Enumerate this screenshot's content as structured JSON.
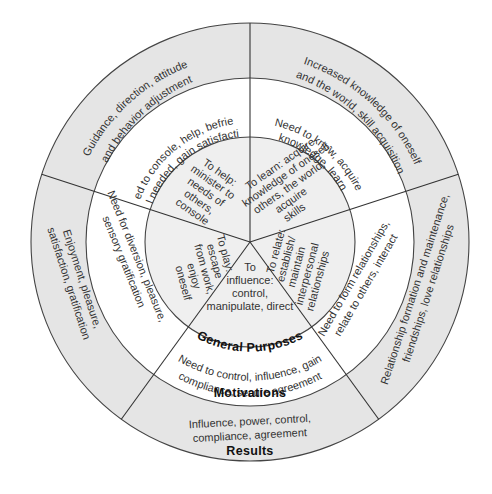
{
  "diagram": {
    "type": "concentric-wheel",
    "center": [
      250,
      242
    ],
    "radii": {
      "results": 219,
      "motivations": 164,
      "general_purposes": 105
    },
    "colors": {
      "results_ring": "#e5e5e5",
      "motivations_ring": "#ffffff",
      "purposes_ring": "#efefef",
      "lines": "#444444"
    },
    "ring_labels": {
      "general_purposes": "General Purposes",
      "motivations": "Motivations",
      "results": "Results"
    },
    "segments": [
      {
        "id": "learn",
        "purpose": [
          "To learn: acquire",
          "knowledge of oneself,",
          "others, the world,",
          "acquire",
          "skills"
        ],
        "motivation": [
          "Need to know, acquire",
          "knowledge, learn"
        ],
        "result": [
          "Increased knowledge of oneself",
          "and the world, skill acquisition"
        ]
      },
      {
        "id": "relate",
        "purpose": [
          "To relate:",
          "establish/",
          "maintain",
          "interpersonal",
          "relationships"
        ],
        "motivation": [
          "Need to form relationships,",
          "relate to others, interact"
        ],
        "result": [
          "Relationship formation and maintenance,",
          "friendships, love relationships"
        ]
      },
      {
        "id": "influence",
        "purpose": [
          "To",
          "influence:",
          "control,",
          "manipulate, direct"
        ],
        "motivation": [
          "Need to control, influence, gain",
          "compliance, secure agreement"
        ],
        "result": [
          "Influence, power, control,",
          "compliance, agreement"
        ]
      },
      {
        "id": "play",
        "purpose": [
          "To play:",
          "escape",
          "from work,",
          "enjoy",
          "oneself"
        ],
        "motivation": [
          "Need for diversion, pleasure,",
          "sensory gratification"
        ],
        "result": [
          "Enjoyment, pleasure,",
          "satisfaction, gratification"
        ]
      },
      {
        "id": "help",
        "purpose": [
          "To help:",
          "minister to",
          "needs of",
          "others,",
          "console"
        ],
        "motivation": [
          "Need to console, help, befriend,",
          "feel needed, gain satisfaction"
        ],
        "result": [
          "Guidance, direction, attitude",
          "and behavior adjustment"
        ]
      }
    ]
  }
}
